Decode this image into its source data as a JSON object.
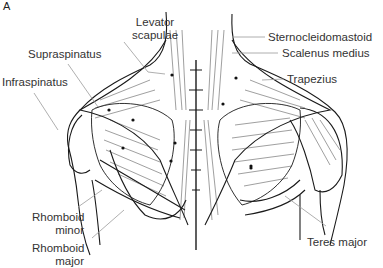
{
  "figure": {
    "panel_label": "A"
  },
  "labels": {
    "levator": [
      "Levator",
      "scapulae"
    ],
    "supraspinatus": "Supraspinatus",
    "infraspinatus": "Infraspinatus",
    "sternocleidomastoid": "Sternocleidomastoid",
    "scalenus": "Scalenus medius",
    "trapezius": "Trapezius",
    "rhomboid_minor": [
      "Rhomboid",
      "minor"
    ],
    "rhomboid_major": [
      "Rhomboid",
      "major"
    ],
    "teres_major": "Teres major"
  },
  "colors": {
    "ink": "#1a1a1a",
    "leader": "#9a9a9a",
    "background": "#ffffff"
  }
}
